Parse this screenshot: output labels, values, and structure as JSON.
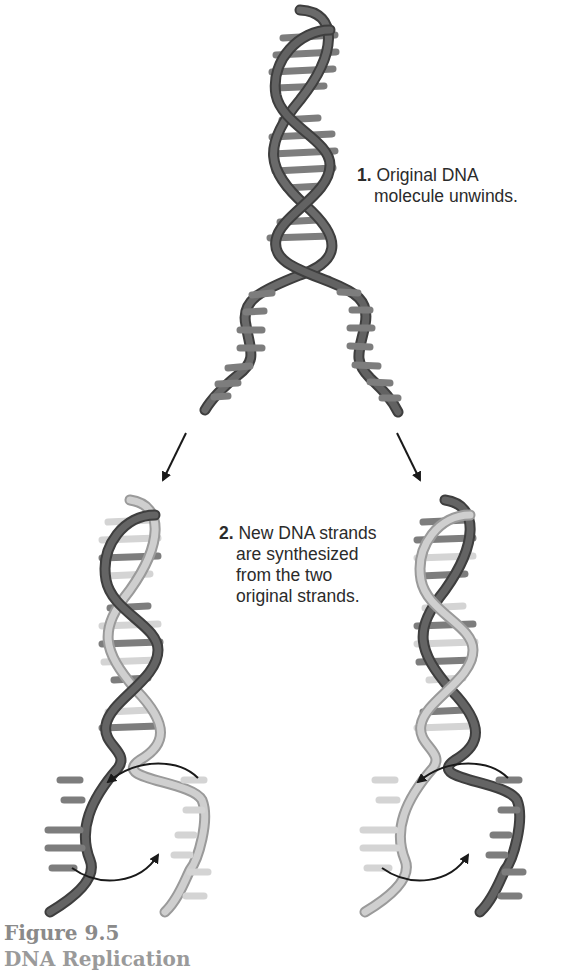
{
  "figure": {
    "caption_title": "Figure 9.5",
    "caption_subtitle": "DNA Replication"
  },
  "steps": [
    {
      "number": "1.",
      "lines": [
        "Original DNA",
        "molecule unwinds."
      ]
    },
    {
      "number": "2.",
      "lines": [
        "New DNA strands",
        "are synthesized",
        "from the two",
        "original strands."
      ]
    }
  ],
  "colors": {
    "original_strand": "#5f5f5f",
    "original_strand_edge": "#3e3e3e",
    "new_strand": "#c9c9c9",
    "new_strand_edge": "#9a9a9a",
    "rung_dark": "#7d7d7d",
    "rung_light": "#d4d4d4",
    "arrow": "#1a1a1a",
    "text": "#2b2b2b",
    "caption": "#8a8a8a"
  },
  "structures": [
    {
      "name": "original-dna-molecule",
      "state": "unwinding"
    },
    {
      "name": "daughter-dna-left",
      "strands": [
        "original",
        "new"
      ]
    },
    {
      "name": "daughter-dna-right",
      "strands": [
        "new",
        "original"
      ]
    }
  ],
  "arrows": [
    {
      "name": "arrow-to-left-daughter",
      "type": "straight"
    },
    {
      "name": "arrow-to-right-daughter",
      "type": "straight"
    },
    {
      "name": "left-synthesis-arrow-upper",
      "type": "curved"
    },
    {
      "name": "left-synthesis-arrow-lower",
      "type": "curved"
    },
    {
      "name": "right-synthesis-arrow-upper",
      "type": "curved"
    },
    {
      "name": "right-synthesis-arrow-lower",
      "type": "curved"
    }
  ]
}
